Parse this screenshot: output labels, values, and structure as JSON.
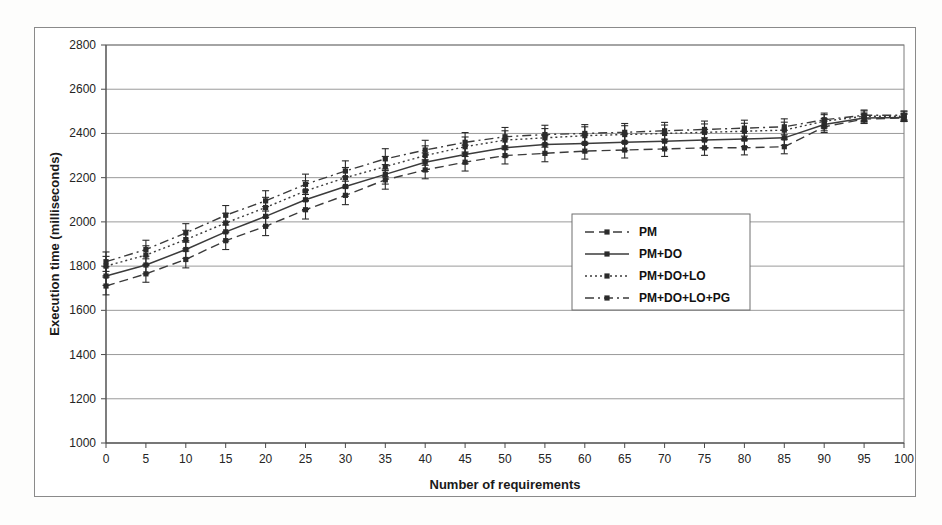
{
  "figure": {
    "background_color": "#ffffff",
    "frame_color": "#8a8a8a"
  },
  "chart_data": {
    "type": "line",
    "title": "",
    "xlabel": "Number of requirements",
    "ylabel": "Execution time (milliseconds)",
    "xlim": [
      0,
      100
    ],
    "ylim": [
      1000,
      2800
    ],
    "xticks": [
      0,
      5,
      10,
      15,
      20,
      25,
      30,
      35,
      40,
      45,
      50,
      55,
      60,
      65,
      70,
      75,
      80,
      85,
      90,
      95,
      100
    ],
    "yticks": [
      1000,
      1200,
      1400,
      1600,
      1800,
      2000,
      2200,
      2400,
      2600,
      2800
    ],
    "grid": "horizontal",
    "legend_position": "center-right",
    "error_bars": true,
    "x": [
      0,
      5,
      10,
      15,
      20,
      25,
      30,
      35,
      40,
      45,
      50,
      55,
      60,
      65,
      70,
      75,
      80,
      85,
      90,
      95,
      100
    ],
    "series": [
      {
        "name": "PM",
        "style": "dashed",
        "color": "#3b3b3b",
        "values": [
          1710,
          1765,
          1830,
          1915,
          1980,
          2055,
          2120,
          2190,
          2235,
          2270,
          2300,
          2310,
          2320,
          2325,
          2330,
          2335,
          2335,
          2340,
          2430,
          2465,
          2470
        ],
        "yerr": [
          40,
          38,
          38,
          40,
          42,
          42,
          42,
          42,
          40,
          40,
          38,
          38,
          36,
          36,
          34,
          34,
          32,
          32,
          26,
          20,
          16
        ]
      },
      {
        "name": "PM+DO",
        "style": "solid",
        "color": "#3b3b3b",
        "values": [
          1755,
          1805,
          1875,
          1955,
          2025,
          2100,
          2160,
          2215,
          2270,
          2305,
          2335,
          2350,
          2355,
          2360,
          2365,
          2370,
          2375,
          2380,
          2440,
          2470,
          2472
        ],
        "yerr": [
          42,
          40,
          40,
          42,
          44,
          44,
          44,
          44,
          42,
          42,
          40,
          40,
          38,
          38,
          36,
          36,
          34,
          34,
          28,
          22,
          18
        ]
      },
      {
        "name": "PM+DO+LO",
        "style": "dotted",
        "color": "#2d2d2d",
        "values": [
          1800,
          1850,
          1920,
          1995,
          2065,
          2140,
          2200,
          2250,
          2300,
          2340,
          2370,
          2380,
          2390,
          2395,
          2400,
          2405,
          2410,
          2415,
          2455,
          2478,
          2478
        ],
        "yerr": [
          44,
          42,
          42,
          44,
          46,
          46,
          46,
          46,
          44,
          44,
          42,
          42,
          40,
          40,
          38,
          38,
          36,
          36,
          30,
          24,
          20
        ]
      },
      {
        "name": "PM+DO+LO+PG",
        "style": "dashdot",
        "color": "#5a5a5a",
        "values": [
          1820,
          1875,
          1950,
          2030,
          2095,
          2170,
          2230,
          2285,
          2325,
          2360,
          2385,
          2395,
          2400,
          2405,
          2412,
          2418,
          2424,
          2430,
          2462,
          2482,
          2482
        ],
        "yerr": [
          44,
          42,
          42,
          44,
          46,
          46,
          46,
          46,
          44,
          44,
          42,
          42,
          40,
          40,
          38,
          38,
          36,
          36,
          30,
          24,
          20
        ]
      }
    ]
  },
  "legend": {
    "entries": [
      {
        "label": "PM",
        "style": "dashed"
      },
      {
        "label": "PM+DO",
        "style": "solid"
      },
      {
        "label": "PM+DO+LO",
        "style": "dotted"
      },
      {
        "label": "PM+DO+LO+PG",
        "style": "dashdot"
      }
    ]
  }
}
